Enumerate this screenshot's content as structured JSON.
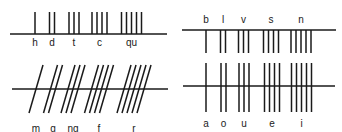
{
  "diagram": {
    "stroke_color": "#1a1a1a",
    "groups": [
      {
        "name": "top-left",
        "baseline": {
          "x1": 10,
          "x2": 167,
          "y": 34
        },
        "stroke_kind": "above",
        "stroke_top": 12,
        "stroke_bottom": 34,
        "slant": 0,
        "label_y": 38,
        "letters": [
          {
            "label": "h",
            "count": 1,
            "x": 35
          },
          {
            "label": "d",
            "count": 2,
            "x": 52
          },
          {
            "label": "t",
            "count": 3,
            "x": 74
          },
          {
            "label": "c",
            "count": 4,
            "x": 99.5
          },
          {
            "label": "qu",
            "count": 5,
            "x": 131.5
          }
        ]
      },
      {
        "name": "bottom-left",
        "baseline": {
          "x1": 12,
          "x2": 168,
          "y": 89
        },
        "stroke_kind": "slanted",
        "stroke_top": 65,
        "stroke_bottom": 113,
        "slant": 14,
        "label_y": 124,
        "letters": [
          {
            "label": "m",
            "count": 1,
            "x": 36
          },
          {
            "label": "g",
            "count": 2,
            "x": 53
          },
          {
            "label": "ng",
            "count": 3,
            "x": 73
          },
          {
            "label": "f",
            "count": 4,
            "x": 99
          },
          {
            "label": "r",
            "count": 5,
            "x": 134
          }
        ]
      },
      {
        "name": "top-right",
        "baseline": {
          "x1": 182,
          "x2": 336,
          "y": 30
        },
        "stroke_kind": "below",
        "stroke_top": 30,
        "stroke_bottom": 53,
        "slant": 0,
        "label_y": 15,
        "letters": [
          {
            "label": "b",
            "count": 1,
            "x": 206
          },
          {
            "label": "l",
            "count": 2,
            "x": 223
          },
          {
            "label": "v",
            "count": 3,
            "x": 243.5
          },
          {
            "label": "s",
            "count": 4,
            "x": 271
          },
          {
            "label": "n",
            "count": 5,
            "x": 301
          }
        ]
      },
      {
        "name": "bottom-right",
        "baseline": {
          "x1": 183,
          "x2": 335,
          "y": 86
        },
        "stroke_kind": "through",
        "stroke_top": 63,
        "stroke_bottom": 112,
        "slant": 0,
        "label_y": 119,
        "letters": [
          {
            "label": "a",
            "count": 1,
            "x": 206
          },
          {
            "label": "o",
            "count": 2,
            "x": 223.5
          },
          {
            "label": "u",
            "count": 3,
            "x": 244
          },
          {
            "label": "e",
            "count": 4,
            "x": 272
          },
          {
            "label": "i",
            "count": 5,
            "x": 301.5
          }
        ]
      }
    ],
    "stroke_spacing": 5
  }
}
